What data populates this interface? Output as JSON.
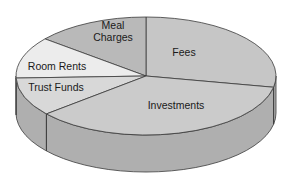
{
  "chart_data": {
    "type": "pie",
    "style": "3d",
    "title": "",
    "unit": "percent",
    "slices": [
      {
        "label": "Fees",
        "value": 28,
        "start_deg": -11,
        "end_deg": 90,
        "color": "#c6c6c6"
      },
      {
        "label": "Meal Charges",
        "label_lines": [
          "Meal",
          "Charges"
        ],
        "value": 14,
        "start_deg": 90,
        "end_deg": 141,
        "color": "#b9b9b9"
      },
      {
        "label": "Room Rents",
        "value": 11,
        "start_deg": 141,
        "end_deg": 182,
        "color": "#ececec"
      },
      {
        "label": "Trust Funds",
        "value": 11,
        "start_deg": 182,
        "end_deg": 220,
        "color": "#d8d8d8"
      },
      {
        "label": "Investments",
        "value": 36,
        "start_deg": 220,
        "end_deg": 349,
        "color": "#cbcbcb"
      }
    ],
    "side_color": "#afafaf",
    "outline_color": "#3a3a3a",
    "legend": "none (labels on slices)"
  },
  "geometry": {
    "cx": 146,
    "cy": 76,
    "rx": 130,
    "ry": 59,
    "depth": 37
  }
}
